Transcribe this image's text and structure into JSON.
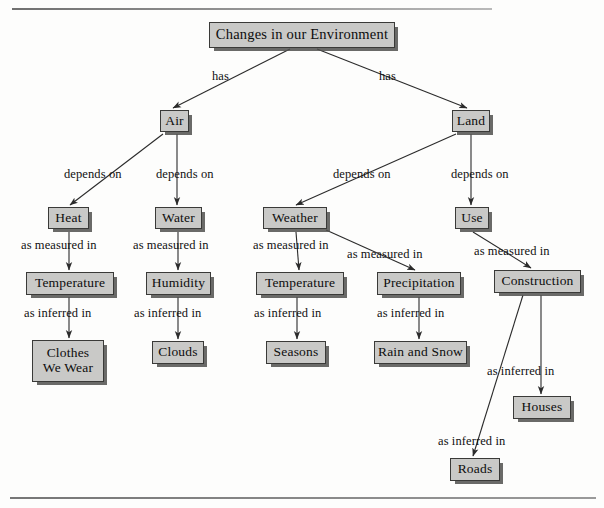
{
  "diagram": {
    "type": "concept-map",
    "title": "Changes in our Environment",
    "rules": {
      "top": "horizontal-rule",
      "bottom": "horizontal-rule"
    },
    "colors": {
      "node_fill": "#c9c9c7",
      "node_border": "#3a3a38",
      "node_shadow": "#50504e",
      "text": "#0d0d0d",
      "edge": "#2b2b2b",
      "background": "#fdfdfc"
    },
    "nodes": [
      {
        "id": "root",
        "label": "Changes in our Environment",
        "x": 209,
        "y": 22,
        "w": 186,
        "h": 26
      },
      {
        "id": "air",
        "label": "Air",
        "x": 160,
        "y": 110,
        "w": 29,
        "h": 22
      },
      {
        "id": "land",
        "label": "Land",
        "x": 452,
        "y": 110,
        "w": 38,
        "h": 22
      },
      {
        "id": "heat",
        "label": "Heat",
        "x": 48,
        "y": 207,
        "w": 41,
        "h": 22
      },
      {
        "id": "water",
        "label": "Water",
        "x": 155,
        "y": 207,
        "w": 47,
        "h": 22
      },
      {
        "id": "weather",
        "label": "Weather",
        "x": 263,
        "y": 207,
        "w": 64,
        "h": 22
      },
      {
        "id": "use",
        "label": "Use",
        "x": 455,
        "y": 207,
        "w": 34,
        "h": 22
      },
      {
        "id": "temperature1",
        "label": "Temperature",
        "x": 26,
        "y": 272,
        "w": 88,
        "h": 23
      },
      {
        "id": "humidity",
        "label": "Humidity",
        "x": 146,
        "y": 272,
        "w": 65,
        "h": 23
      },
      {
        "id": "temperature2",
        "label": "Temperature",
        "x": 256,
        "y": 272,
        "w": 88,
        "h": 23
      },
      {
        "id": "precipitation",
        "label": "Precipitation",
        "x": 377,
        "y": 272,
        "w": 84,
        "h": 23
      },
      {
        "id": "construction",
        "label": "Construction",
        "x": 494,
        "y": 270,
        "w": 87,
        "h": 23
      },
      {
        "id": "clothes",
        "label": "Clothes\nWe Wear",
        "x": 32,
        "y": 340,
        "w": 72,
        "h": 42
      },
      {
        "id": "clouds",
        "label": "Clouds",
        "x": 152,
        "y": 341,
        "w": 52,
        "h": 23
      },
      {
        "id": "seasons",
        "label": "Seasons",
        "x": 266,
        "y": 341,
        "w": 60,
        "h": 23
      },
      {
        "id": "rainsnow",
        "label": "Rain and Snow",
        "x": 374,
        "y": 341,
        "w": 93,
        "h": 23
      },
      {
        "id": "houses",
        "label": "Houses",
        "x": 513,
        "y": 396,
        "w": 58,
        "h": 23
      },
      {
        "id": "roads",
        "label": "Roads",
        "x": 450,
        "y": 458,
        "w": 50,
        "h": 23
      }
    ],
    "edges": [
      {
        "from": "root",
        "to": "air",
        "label": "has",
        "label_x": 212,
        "label_y": 69,
        "x1": 290,
        "y1": 49,
        "x2": 173,
        "y2": 108
      },
      {
        "from": "root",
        "to": "land",
        "label": "has",
        "label_x": 379,
        "label_y": 69,
        "x1": 317,
        "y1": 49,
        "x2": 467,
        "y2": 108
      },
      {
        "from": "air",
        "to": "heat",
        "label": "depends on",
        "label_x": 64,
        "label_y": 167,
        "x1": 163,
        "y1": 134,
        "x2": 70,
        "y2": 205
      },
      {
        "from": "air",
        "to": "water",
        "label": "depends on",
        "label_x": 156,
        "label_y": 167,
        "x1": 177,
        "y1": 134,
        "x2": 177,
        "y2": 205
      },
      {
        "from": "land",
        "to": "weather",
        "label": "depends on",
        "label_x": 333,
        "label_y": 167,
        "x1": 456,
        "y1": 134,
        "x2": 296,
        "y2": 205
      },
      {
        "from": "land",
        "to": "use",
        "label": "depends on",
        "label_x": 451,
        "label_y": 167,
        "x1": 471,
        "y1": 134,
        "x2": 471,
        "y2": 205
      },
      {
        "from": "heat",
        "to": "temperature1",
        "label": "as measured in",
        "label_x": 21,
        "label_y": 238,
        "x1": 69,
        "y1": 232,
        "x2": 69,
        "y2": 270
      },
      {
        "from": "water",
        "to": "humidity",
        "label": "as measured in",
        "label_x": 133,
        "label_y": 238,
        "x1": 178,
        "y1": 232,
        "x2": 178,
        "y2": 270
      },
      {
        "from": "weather",
        "to": "temperature2",
        "label": "as measured in",
        "label_x": 253,
        "label_y": 238,
        "x1": 296,
        "y1": 232,
        "x2": 299,
        "y2": 270
      },
      {
        "from": "weather",
        "to": "precipitation",
        "label": "as measured in",
        "label_x": 347,
        "label_y": 247,
        "x1": 326,
        "y1": 230,
        "x2": 415,
        "y2": 270
      },
      {
        "from": "use",
        "to": "construction",
        "label": "as measured in",
        "label_x": 474,
        "label_y": 244,
        "x1": 473,
        "y1": 232,
        "x2": 531,
        "y2": 268
      },
      {
        "from": "temperature1",
        "to": "clothes",
        "label": "as inferred in",
        "label_x": 24,
        "label_y": 306,
        "x1": 69,
        "y1": 297,
        "x2": 69,
        "y2": 338
      },
      {
        "from": "humidity",
        "to": "clouds",
        "label": "as inferred in",
        "label_x": 134,
        "label_y": 306,
        "x1": 178,
        "y1": 297,
        "x2": 178,
        "y2": 339
      },
      {
        "from": "temperature2",
        "to": "seasons",
        "label": "as inferred in",
        "label_x": 254,
        "label_y": 306,
        "x1": 297,
        "y1": 297,
        "x2": 297,
        "y2": 339
      },
      {
        "from": "precipitation",
        "to": "rainsnow",
        "label": "as inferred in",
        "label_x": 377,
        "label_y": 306,
        "x1": 419,
        "y1": 297,
        "x2": 419,
        "y2": 339
      },
      {
        "from": "construction",
        "to": "houses",
        "label": "as inferred in",
        "label_x": 487,
        "label_y": 364,
        "x1": 541,
        "y1": 295,
        "x2": 541,
        "y2": 394
      },
      {
        "from": "construction",
        "to": "roads",
        "label": "as inferred in",
        "label_x": 438,
        "label_y": 434,
        "x1": 523,
        "y1": 295,
        "x2": 473,
        "y2": 456
      }
    ]
  }
}
